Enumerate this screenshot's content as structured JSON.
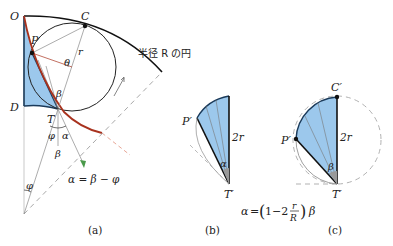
{
  "panel_a": {
    "caption": "(a)",
    "points": {
      "O": "O",
      "C": "C",
      "P": "P",
      "D": "D",
      "T": "T"
    },
    "labels": {
      "theta": "θ",
      "r": "r",
      "beta": "β",
      "phi": "φ",
      "alpha": "α",
      "beta2": "β",
      "phi2": "φ"
    },
    "circle_label": "半径 R の円",
    "equation": "α = β − φ"
  },
  "panel_b": {
    "caption": "(b)",
    "points": {
      "P": "P′",
      "T": "T′"
    },
    "labels": {
      "diameter": "2r",
      "alpha": "α"
    }
  },
  "panel_c": {
    "caption": "(c)",
    "points": {
      "C": "C′",
      "P": "P′",
      "T": "T′"
    },
    "labels": {
      "diameter": "2r",
      "beta": "β"
    }
  },
  "shared_equation": {
    "lhs": "α",
    "eq": "=",
    "open": "(",
    "one_minus_two": "1−2",
    "num": "r",
    "den": "R",
    "close": ")",
    "rhs": "β"
  },
  "colors": {
    "fill_blue": "#9cc8ec",
    "curve_red": "#a8321e",
    "dash_gray": "#a8a8a8",
    "green_arrow": "#4a9a4a"
  }
}
